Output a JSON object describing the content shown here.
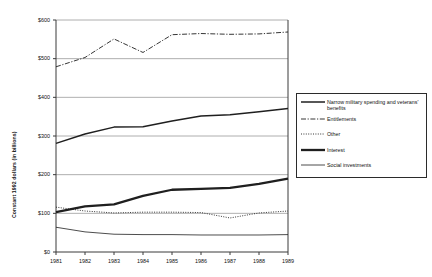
{
  "chart_data": {
    "type": "line",
    "title": "",
    "xlabel": "",
    "ylabel": "Constant 1992 dollars (in billions)",
    "x": [
      1981,
      1982,
      1983,
      1984,
      1985,
      1986,
      1987,
      1988,
      1989
    ],
    "categories": [
      "1981",
      "1982",
      "1983",
      "1984",
      "1985",
      "1986",
      "1987",
      "1988",
      "1989"
    ],
    "ylim": [
      0,
      600
    ],
    "yticks": [
      0,
      100,
      200,
      300,
      400,
      500,
      600
    ],
    "ytick_labels": [
      "$0",
      "$100",
      "$200",
      "$300",
      "$400",
      "$500",
      "$600"
    ],
    "grid": "horizontal",
    "legend_position": "right",
    "series": [
      {
        "name": "Narrow military spending and veterans' benefits",
        "style": "solid-medium",
        "values": [
          281,
          305,
          323,
          324,
          339,
          352,
          355,
          363,
          371
        ]
      },
      {
        "name": "Entitlements",
        "style": "dash-dot",
        "values": [
          479,
          503,
          551,
          516,
          562,
          565,
          563,
          564,
          569
        ]
      },
      {
        "name": "Other",
        "style": "dotted",
        "values": [
          116,
          106,
          101,
          103,
          103,
          102,
          88,
          101,
          106
        ]
      },
      {
        "name": "Interest",
        "style": "solid-thick",
        "values": [
          103,
          118,
          123,
          145,
          161,
          163,
          166,
          176,
          190
        ]
      },
      {
        "name": "Social investments",
        "style": "solid-thin",
        "values": [
          64,
          52,
          46,
          45,
          45,
          44,
          44,
          44,
          45
        ]
      }
    ]
  },
  "legend": {
    "items": [
      {
        "label": "Narrow military spending and veterans' benefits",
        "style": "solid-medium"
      },
      {
        "label": "Entitlements",
        "style": "dash-dot"
      },
      {
        "label": "Other",
        "style": "dotted"
      },
      {
        "label": "Interest",
        "style": "solid-thick"
      },
      {
        "label": "Social investments",
        "style": "solid-thin"
      }
    ]
  },
  "colors": {
    "line": "#1f1f1f",
    "grid": "#9a9a9a",
    "axis": "#3a3a3a",
    "background": "#ffffff"
  }
}
